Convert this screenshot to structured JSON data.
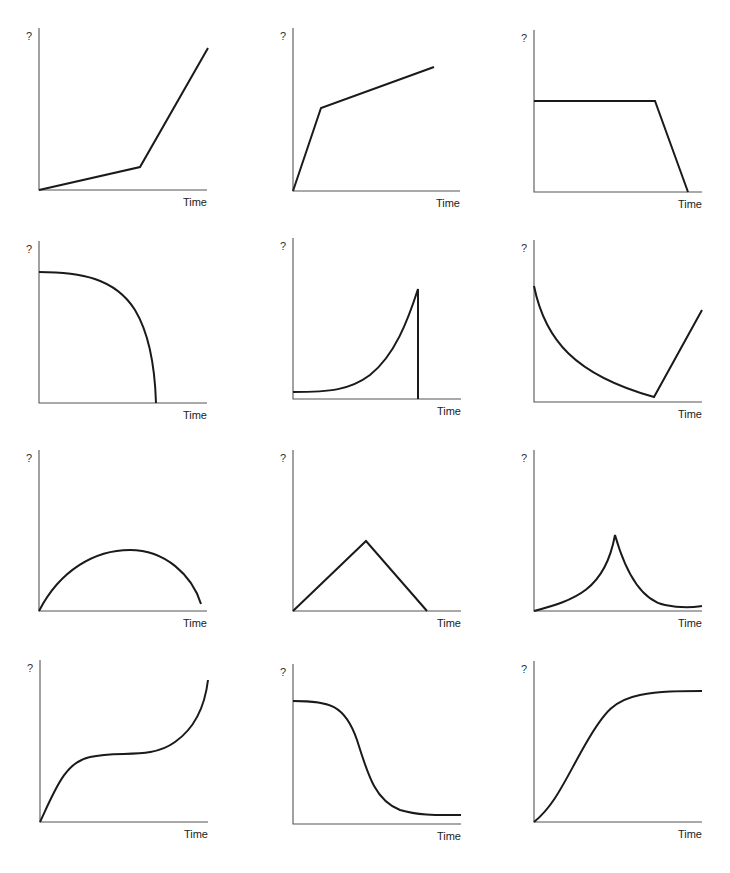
{
  "figure": {
    "y_axis_label": "?",
    "x_axis_label": "Time",
    "line_color": "#1a1a1a",
    "axis_color": "#555555"
  },
  "chart_data": [
    {
      "id": "graph-1",
      "type": "line",
      "title": "",
      "xlabel": "Time",
      "ylabel": "?",
      "description": "slow linear rise, then steep linear rise",
      "axis": {
        "x": 39,
        "top": 28,
        "bottom": 190,
        "right": 207
      },
      "path": "M39,190 L140,167 L208,48",
      "points": [
        [
          0,
          0
        ],
        [
          0.6,
          0.14
        ],
        [
          1.0,
          0.87
        ]
      ]
    },
    {
      "id": "graph-2",
      "type": "line",
      "title": "",
      "xlabel": "Time",
      "ylabel": "?",
      "description": "steep linear rise, then gentle linear rise",
      "axis": {
        "x": 293,
        "top": 28,
        "bottom": 191,
        "right": 460
      },
      "path": "M293,191 L321,108 L434,67",
      "points": [
        [
          0,
          0
        ],
        [
          0.17,
          0.51
        ],
        [
          0.84,
          0.76
        ]
      ]
    },
    {
      "id": "graph-3",
      "type": "line",
      "title": "",
      "xlabel": "Time",
      "ylabel": "?",
      "description": "constant level, then steep linear drop to zero",
      "axis": {
        "x": 534,
        "top": 30,
        "bottom": 192,
        "right": 702
      },
      "path": "M534,101 L655,101 L688,192",
      "points": [
        [
          0,
          0.56
        ],
        [
          0.72,
          0.56
        ],
        [
          0.92,
          0
        ]
      ]
    },
    {
      "id": "graph-4",
      "type": "line",
      "title": "",
      "xlabel": "Time",
      "ylabel": "?",
      "description": "nearly flat high level curving down steeply to zero",
      "axis": {
        "x": 39,
        "top": 241,
        "bottom": 403,
        "right": 207
      },
      "path": "M39,272 C80,272 115,278 135,310 C150,335 155,370 156,403",
      "points": [
        [
          0,
          0.81
        ],
        [
          0.35,
          0.78
        ],
        [
          0.57,
          0.57
        ],
        [
          0.7,
          0
        ]
      ]
    },
    {
      "id": "graph-5",
      "type": "line",
      "title": "",
      "xlabel": "Time",
      "ylabel": "?",
      "description": "exponential-like growth then sudden vertical drop to zero",
      "axis": {
        "x": 293,
        "top": 238,
        "bottom": 399,
        "right": 461
      },
      "path": "M293,392 C330,392 350,390 370,375 C395,355 408,320 418,289 L418,399",
      "points": [
        [
          0,
          0.04
        ],
        [
          0.46,
          0.15
        ],
        [
          0.74,
          0.68
        ],
        [
          0.74,
          0
        ]
      ]
    },
    {
      "id": "graph-6",
      "type": "line",
      "title": "",
      "xlabel": "Time",
      "ylabel": "?",
      "description": "exponential decay to a minimum, then linear rise",
      "axis": {
        "x": 534,
        "top": 240,
        "bottom": 402,
        "right": 702
      },
      "path": "M534,286 C545,340 575,375 654,397 L702,310",
      "points": [
        [
          0,
          0.72
        ],
        [
          0.71,
          0.03
        ],
        [
          1.0,
          0.57
        ]
      ]
    },
    {
      "id": "graph-7",
      "type": "line",
      "title": "",
      "xlabel": "Time",
      "ylabel": "?",
      "description": "rises and falls in an asymmetric arch",
      "axis": {
        "x": 39,
        "top": 450,
        "bottom": 611,
        "right": 207
      },
      "path": "M39,611 C60,570 95,550 130,550 C165,550 192,575 201,604",
      "points": [
        [
          0,
          0
        ],
        [
          0.54,
          0.38
        ],
        [
          0.96,
          0.04
        ]
      ]
    },
    {
      "id": "graph-8",
      "type": "line",
      "title": "",
      "xlabel": "Time",
      "ylabel": "?",
      "description": "linear rise to a peak, then linear fall to zero",
      "axis": {
        "x": 293,
        "top": 450,
        "bottom": 611,
        "right": 461
      },
      "path": "M293,611 L366,541 L427,611",
      "points": [
        [
          0,
          0
        ],
        [
          0.43,
          0.43
        ],
        [
          0.8,
          0
        ]
      ]
    },
    {
      "id": "graph-9",
      "type": "line",
      "title": "",
      "xlabel": "Time",
      "ylabel": "?",
      "description": "accelerating rise to a sharp cusp peak, then decaying fall leveling off",
      "axis": {
        "x": 534,
        "top": 450,
        "bottom": 611,
        "right": 702
      },
      "path": "M534,611 C575,600 605,590 615,535 C625,570 640,600 665,605 C685,609 695,607 702,606",
      "points": [
        [
          0,
          0
        ],
        [
          0.48,
          0.47
        ],
        [
          0.78,
          0.04
        ],
        [
          1.0,
          0.03
        ]
      ]
    },
    {
      "id": "graph-10",
      "type": "line",
      "title": "",
      "xlabel": "Time",
      "ylabel": "?",
      "description": "rises, plateaus, then rises steeply",
      "axis": {
        "x": 40,
        "top": 660,
        "bottom": 822,
        "right": 208
      },
      "path": "M40,822 C55,790 65,762 90,757 C120,750 150,760 175,742 C195,728 205,705 208,680",
      "points": [
        [
          0,
          0
        ],
        [
          0.3,
          0.41
        ],
        [
          0.65,
          0.44
        ],
        [
          1.0,
          0.88
        ]
      ]
    },
    {
      "id": "graph-11",
      "type": "line",
      "title": "",
      "xlabel": "Time",
      "ylabel": "?",
      "description": "high plateau, sigmoidal decline, low plateau",
      "axis": {
        "x": 293,
        "top": 664,
        "bottom": 824,
        "right": 461
      },
      "path": "M293,701 C330,701 345,705 357,740 C368,775 375,800 400,810 C420,816 440,815 461,815",
      "points": [
        [
          0,
          0.77
        ],
        [
          0.38,
          0.53
        ],
        [
          0.64,
          0.09
        ],
        [
          1.0,
          0.06
        ]
      ]
    },
    {
      "id": "graph-12",
      "type": "line",
      "title": "",
      "xlabel": "Time",
      "ylabel": "?",
      "description": "S-shaped logistic growth to a plateau",
      "axis": {
        "x": 534,
        "top": 661,
        "bottom": 822,
        "right": 702
      },
      "path": "M534,822 C555,805 565,780 585,745 C605,710 615,700 640,695 C660,691 680,691 702,691",
      "points": [
        [
          0,
          0
        ],
        [
          0.3,
          0.48
        ],
        [
          0.63,
          0.79
        ],
        [
          1.0,
          0.81
        ]
      ]
    }
  ]
}
